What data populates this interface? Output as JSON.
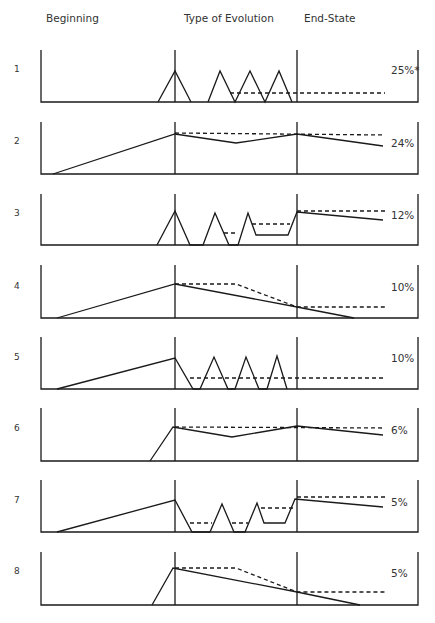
{
  "headers": {
    "beginning": "Beginning",
    "evolution": "Type of Evolution",
    "endstate": "End-State"
  },
  "rows": [
    {
      "num": "1",
      "pct": "25%*"
    },
    {
      "num": "2",
      "pct": "24%"
    },
    {
      "num": "3",
      "pct": "12%"
    },
    {
      "num": "4",
      "pct": "10%"
    },
    {
      "num": "5",
      "pct": "10%"
    },
    {
      "num": "6",
      "pct": "6%"
    },
    {
      "num": "7",
      "pct": "5%"
    },
    {
      "num": "8",
      "pct": "5%"
    }
  ],
  "colors": {
    "line": "#1a1a1a"
  }
}
